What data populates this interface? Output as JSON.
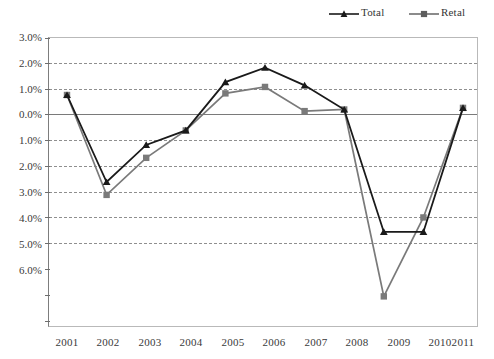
{
  "chart_data": {
    "type": "line",
    "title": "",
    "subtitle": "",
    "xlabel": "",
    "ylabel": "",
    "categories": [
      "2001",
      "2002",
      "2003",
      "2004",
      "2005",
      "2006",
      "2007",
      "2008",
      "2009",
      "2010",
      "2011"
    ],
    "series": [
      {
        "name": "Total",
        "marker": "triangle",
        "color": "#1a1a1a",
        "values": [
          1.2,
          -1.5,
          -0.35,
          0.1,
          1.6,
          2.05,
          1.5,
          0.75,
          -3.05,
          -3.05,
          0.8
        ]
      },
      {
        "name": "Retail",
        "marker": "square",
        "color": "#7a7a7a",
        "values": [
          1.2,
          -1.9,
          -0.75,
          0.1,
          1.25,
          1.45,
          0.7,
          0.75,
          -5.05,
          -2.6,
          0.8
        ]
      }
    ],
    "ylim": [
      -6.0,
      3.0
    ],
    "ytick_values": [
      3.0,
      2.0,
      1.0,
      0.0,
      -1.0,
      -2.0,
      -3.0,
      -4.0,
      -5.0,
      -6.0
    ],
    "ytick_labels": [
      "3.0%",
      "2.0%",
      "1.0%",
      "0.0%",
      "1.0%",
      "2.0%",
      "3.0%",
      "4.0%",
      "5.0%",
      "6.0%"
    ],
    "grid": true,
    "legend_position": "top-right"
  },
  "legend": {
    "entries": [
      {
        "label": "Total",
        "marker": "triangle-marker",
        "color": "#1a1a1a"
      },
      {
        "label": "Retal",
        "marker": "square-marker",
        "color": "#7a7a7a"
      }
    ]
  },
  "axes": {
    "y": {
      "labels": [
        "3.0%",
        "2.0%",
        "1.0%",
        "0.0%",
        "1.0%",
        "2.0%",
        "3.0%",
        "4.0%",
        "5.0%",
        "6.0%"
      ]
    },
    "x": {
      "labels": [
        "2001",
        "2002",
        "2003",
        "2004",
        "2005",
        "2006",
        "2007",
        "2008",
        "2009",
        "2010",
        "2011"
      ]
    }
  }
}
